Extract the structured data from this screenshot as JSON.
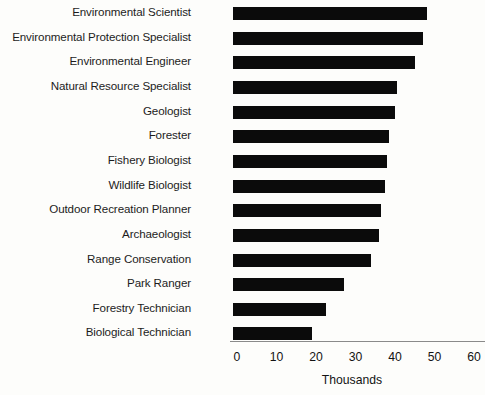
{
  "chart_data": {
    "type": "bar",
    "orientation": "horizontal",
    "title": "",
    "xlabel": "Thousands",
    "ylabel": "",
    "xlim": [
      0,
      60
    ],
    "xticks": [
      0,
      10,
      20,
      30,
      40,
      50,
      60
    ],
    "xtick_labels": [
      "0",
      "10",
      "20",
      "30",
      "40",
      "50",
      "60"
    ],
    "grid": false,
    "legend": false,
    "bar_color": "#0b0b0b",
    "axis_color": "#8a8a8a",
    "categories": [
      "Environmental Scientist",
      "Environmental Protection Specialist",
      "Environmental Engineer",
      "Natural Resource Specialist",
      "Geologist",
      "Forester",
      "Fishery Biologist",
      "Wildlife Biologist",
      "Outdoor Recreation Planner",
      "Archaeologist",
      "Range Conservation",
      "Park Ranger",
      "Forestry Technician",
      "Biological Technician"
    ],
    "values": [
      49,
      48,
      46,
      41.5,
      41,
      39.5,
      39,
      38.5,
      37.5,
      37,
      35,
      28,
      23.5,
      20
    ]
  },
  "axis": {
    "title": "Thousands"
  }
}
